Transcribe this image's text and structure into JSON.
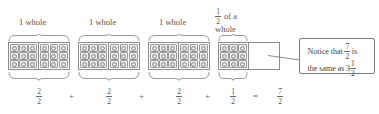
{
  "figure": {
    "wholes": [
      {
        "label": "1 whole",
        "fraction": {
          "numerator": "2",
          "denominator": "2"
        },
        "filled_halves": 2
      },
      {
        "label": "1 whole",
        "fraction": {
          "numerator": "2",
          "denominator": "2"
        },
        "filled_halves": 2
      },
      {
        "label": "1 whole",
        "fraction": {
          "numerator": "2",
          "denominator": "2"
        },
        "filled_halves": 2
      }
    ],
    "partial": {
      "label_prefix": "of a",
      "label_suffix": "whole",
      "label_fraction": {
        "numerator": "1",
        "denominator": "2"
      },
      "fraction": {
        "numerator": "1",
        "denominator": "2"
      },
      "filled_halves": 1
    },
    "operators": {
      "plus": "+",
      "equals": "="
    },
    "result": {
      "numerator": "7",
      "denominator": "2"
    },
    "callout": {
      "line1_prefix": "Notice that",
      "line1_fraction": {
        "numerator": "7",
        "denominator": "2"
      },
      "line1_suffix": "is",
      "line2_prefix": "the same as",
      "line2_whole": "3",
      "line2_fraction": {
        "numerator": "1",
        "denominator": "2"
      }
    },
    "chip_icon": "smiley-face-icon",
    "colors": {
      "box_border": "#8c8c8c",
      "chip_fill": "#efefef",
      "text": "#555555",
      "callout_border": "#7d7d7d"
    }
  }
}
